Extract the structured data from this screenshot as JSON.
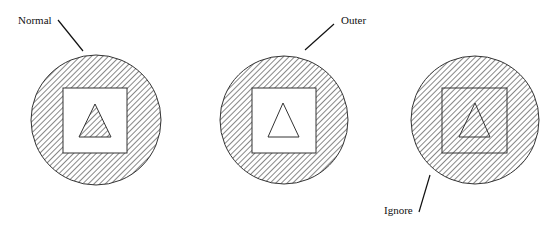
{
  "diagram": {
    "colors": {
      "stroke": "#333333",
      "hatch": "#555555",
      "background": "#ffffff",
      "label": "#111111"
    },
    "hatch_pattern": "diagonal-45",
    "panels": [
      {
        "id": "normal",
        "label": "Normal",
        "filled": {
          "circle": true,
          "square": false,
          "triangle": true
        }
      },
      {
        "id": "outer",
        "label": "Outer",
        "filled": {
          "circle": true,
          "square": false,
          "triangle": false
        }
      },
      {
        "id": "ignore",
        "label": "Ignore",
        "filled": {
          "circle": true,
          "square": true,
          "triangle": true
        }
      }
    ]
  }
}
